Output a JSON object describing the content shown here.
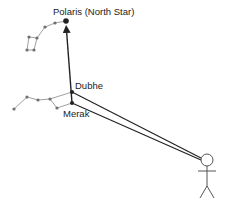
{
  "diagram": {
    "labels": {
      "polaris": "Polaris (North Star)",
      "dubhe": "Dubhe",
      "merak": "Merak"
    },
    "colors": {
      "background": "#ffffff",
      "constellation_line": "#a0a0a0",
      "star": "#707070",
      "key_star": "#222222",
      "sight_line": "#222222",
      "figure": "#555555"
    },
    "stars": {
      "polaris": [
        66,
        21
      ],
      "dubhe": [
        72,
        92
      ],
      "merak": [
        72,
        103
      ],
      "little_dipper": [
        [
          66,
          21
        ],
        [
          55,
          23
        ],
        [
          45,
          27
        ],
        [
          37,
          38
        ],
        [
          34,
          50
        ],
        [
          27,
          50
        ],
        [
          29,
          37
        ],
        [
          37,
          38
        ]
      ],
      "big_dipper": [
        [
          72,
          92
        ],
        [
          50,
          99
        ],
        [
          38,
          100
        ],
        [
          27,
          97
        ],
        [
          14,
          109
        ]
      ],
      "big_dipper_bowl_link": [
        [
          50,
          99
        ],
        [
          57,
          108
        ],
        [
          72,
          103
        ]
      ]
    },
    "observer": {
      "head": [
        207,
        160
      ],
      "head_radius": 6
    }
  }
}
